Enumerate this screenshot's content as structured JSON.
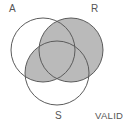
{
  "figure": {
    "kind": "venn-diagram",
    "title": "",
    "sets": [
      {
        "id": "A",
        "label": "A",
        "cx": 43,
        "cy": 50,
        "r": 32,
        "label_pos": "top-left"
      },
      {
        "id": "R",
        "label": "R",
        "cx": 71,
        "cy": 50,
        "r": 32,
        "label_pos": "top-right"
      },
      {
        "id": "S",
        "label": "S",
        "cx": 57,
        "cy": 73,
        "r": 32,
        "label_pos": "bottom-center"
      }
    ],
    "status_label": "VALID",
    "shading": {
      "description": "R union (A intersect S)",
      "shaded_regions": [
        "R only",
        "A and R",
        "R and S",
        "A and R and S",
        "A and S"
      ],
      "unshaded_regions": [
        "A only",
        "S only",
        "outside"
      ],
      "fill_color": "#bababa",
      "stroke_color": "#5b5b5b"
    },
    "colors": {
      "background": "#ffffff",
      "outline": "#5b5b5b",
      "shade": "#bababa",
      "text": "#555555"
    }
  }
}
